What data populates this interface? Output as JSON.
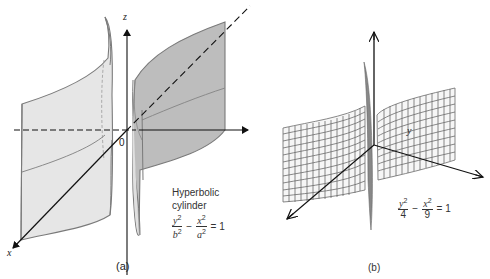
{
  "figure_a": {
    "caption": "(a)",
    "title_line1": "Hyperbolic",
    "title_line2": "cylinder",
    "equation": {
      "term1_num": "y",
      "term1_den": "b",
      "term2_num": "x",
      "term2_den": "a",
      "exp": "2",
      "minus": "−",
      "equals": "= 1"
    },
    "axes": {
      "x": "x",
      "y": "y",
      "z": "z",
      "origin": "0"
    }
  },
  "figure_b": {
    "caption": "(b)",
    "equation": {
      "term1_num": "y",
      "term1_den": "4",
      "term2_num": "x",
      "term2_den": "9",
      "exp": "2",
      "minus": "−",
      "equals": "= 1"
    }
  },
  "colors": {
    "surface_light": "#e3e3e3",
    "surface_dark": "#bdbdbd",
    "edge": "#777777",
    "axis": "#111111",
    "mesh": "#6a6a6a"
  }
}
